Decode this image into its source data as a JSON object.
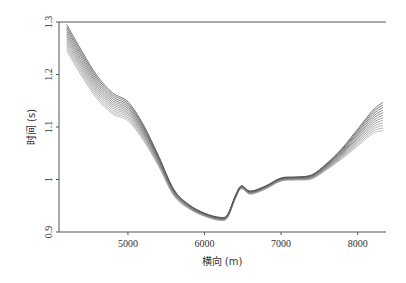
{
  "chart_data": {
    "type": "line",
    "title": "",
    "xlabel": "横向 (m)",
    "ylabel": "时间 (s)",
    "xlim": [
      4100,
      8370
    ],
    "ylim": [
      0.9,
      1.3
    ],
    "xticks": [
      5000,
      6000,
      7000,
      8000
    ],
    "xtick_labels": [
      "5000",
      "6000",
      "7000",
      "8000"
    ],
    "yticks": [
      0.9,
      1.0,
      1.1,
      1.2,
      1.3
    ],
    "ytick_labels": [
      "0.9",
      "1",
      "1.1",
      "1.2",
      "1.3"
    ],
    "grid": false,
    "legend": null,
    "n_series": 12,
    "series_description": "Family of 12 near-parallel gray curves (a fan/band), diverging at both ends and converging near the minimum",
    "x": [
      4200,
      4400,
      4600,
      4800,
      5000,
      5200,
      5400,
      5600,
      5800,
      6000,
      6200,
      6300,
      6400,
      6480,
      6600,
      6800,
      7000,
      7200,
      7400,
      7600,
      7800,
      8000,
      8200,
      8330
    ],
    "base_values": [
      1.27,
      1.22,
      1.175,
      1.145,
      1.13,
      1.09,
      1.035,
      0.975,
      0.948,
      0.933,
      0.925,
      0.93,
      0.965,
      0.985,
      0.975,
      0.985,
      1.0,
      1.002,
      1.005,
      1.025,
      1.05,
      1.08,
      1.11,
      1.12
    ],
    "spread": [
      0.025,
      0.024,
      0.022,
      0.02,
      0.018,
      0.015,
      0.01,
      0.006,
      0.004,
      0.003,
      0.003,
      0.003,
      0.003,
      0.003,
      0.003,
      0.003,
      0.003,
      0.003,
      0.004,
      0.006,
      0.01,
      0.016,
      0.022,
      0.027
    ],
    "line_color_range": [
      "#b0b0b0",
      "#505050"
    ]
  }
}
